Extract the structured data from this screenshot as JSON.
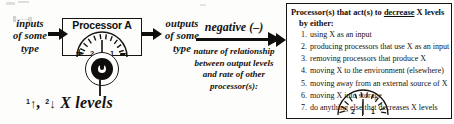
{
  "diagram": {
    "inputs_label": "inputs\nof some\ntype",
    "outputs_label": "outputs\nof some\ntype",
    "processor": {
      "title": "Processor A",
      "plus_sign": "+",
      "minus_sign": "–",
      "gauge_tick_left": "2",
      "gauge_tick_right": "1"
    },
    "x_levels": {
      "tick_one": "1",
      "arrow_up": "↑",
      "separator": ", ",
      "tick_two": "2",
      "arrow_down": "↓",
      "text": "X levels"
    },
    "relationship": {
      "sign_label": "negative (–)",
      "caption_line1": "nature of relationship",
      "caption_line2": "between output levels",
      "caption_line3": "and rate of other",
      "caption_line4": "processor(s):"
    },
    "panel": {
      "heading_part1": "Processor(s) that act(s) to ",
      "heading_underlined": "decrease",
      "heading_part2": " X levels",
      "heading_line2": "by either:",
      "items": [
        {
          "num": "1.",
          "text": "using X as an input"
        },
        {
          "num": "2.",
          "text": "producing processors that use X as an input"
        },
        {
          "num": "3.",
          "text": "removing processors that produce X"
        },
        {
          "num": "4.",
          "text": "moving X to the environment (elsewhere)"
        },
        {
          "num": "5.",
          "text": "moving away from an external source of X"
        },
        {
          "num": "6.",
          "text": "moving X into storage"
        },
        {
          "num": "7.",
          "text": "do anything else that decreases X levels"
        }
      ],
      "gauge_tick_left": "2",
      "gauge_tick_right": "1"
    },
    "colors": {
      "ink": "#100e0c",
      "paper": "#fdfdfc",
      "panel_border": "#15120f"
    }
  }
}
